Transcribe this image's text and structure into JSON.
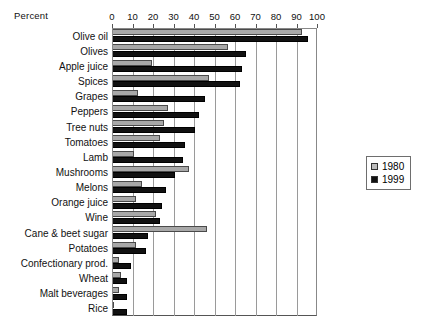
{
  "chart_data": {
    "type": "bar",
    "orientation": "horizontal",
    "title": "",
    "xlabel": "Percent",
    "ylabel": "",
    "xlim": [
      0,
      100
    ],
    "xticks": [
      0,
      10,
      20,
      30,
      40,
      50,
      60,
      70,
      80,
      90,
      100
    ],
    "grid": true,
    "legend_position": "right",
    "categories": [
      "Olive oil",
      "Olives",
      "Apple juice",
      "Spices",
      "Grapes",
      "Peppers",
      "Tree nuts",
      "Tomatoes",
      "Lamb",
      "Mushrooms",
      "Melons",
      "Orange juice",
      "Wine",
      "Cane & beet sugar",
      "Potatoes",
      "Confectionary prod.",
      "Wheat",
      "Malt beverages",
      "Rice"
    ],
    "series": [
      {
        "name": "1980",
        "color": "#a8a8a8",
        "values": [
          92,
          56,
          19,
          47,
          12,
          27,
          25,
          23,
          10,
          37,
          14,
          11,
          21,
          46,
          11,
          3,
          4,
          3,
          0
        ]
      },
      {
        "name": "1999",
        "color": "#111111",
        "values": [
          95,
          65,
          63,
          62,
          45,
          42,
          40,
          35,
          34,
          30,
          26,
          24,
          23,
          17,
          16,
          9,
          7,
          7,
          7
        ]
      }
    ]
  },
  "legend": {
    "items": [
      {
        "label": "1980",
        "swatch": "swatch-1980"
      },
      {
        "label": "1999",
        "swatch": "swatch-1999"
      }
    ]
  }
}
